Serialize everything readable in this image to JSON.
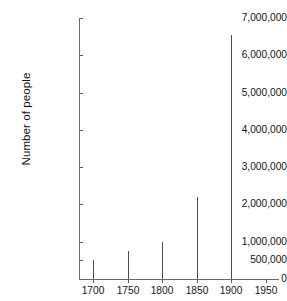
{
  "chart_data": {
    "type": "bar",
    "title": "",
    "subtitle": "",
    "xlabel": "",
    "ylabel": "Number of people",
    "categories": [
      "1700",
      "1750",
      "1800",
      "1850",
      "1900"
    ],
    "x": [
      1700,
      1750,
      1800,
      1850,
      1900
    ],
    "values": [
      500000,
      750000,
      1000000,
      2200000,
      6550000
    ],
    "xlim": [
      1675,
      1960
    ],
    "ylim": [
      0,
      7000000
    ],
    "x_ticks": [
      1700,
      1750,
      1800,
      1850,
      1900,
      1950
    ],
    "x_tick_labels": [
      "1700",
      "1750",
      "1800",
      "1850",
      "1900",
      "1950"
    ],
    "y_ticks": [
      0,
      500000,
      1000000,
      2000000,
      3000000,
      4000000,
      5000000,
      6000000,
      7000000
    ],
    "y_tick_labels": [
      "0",
      "500,000",
      "1,000,000",
      "2,000,000",
      "3,000,000",
      "4,000,000",
      "5,000,000",
      "6,000,000",
      "7,000,000"
    ],
    "grid": false,
    "legend": false,
    "legend_position": "none",
    "series": [
      {
        "name": "Number of people",
        "values": [
          500000,
          750000,
          1000000,
          2200000,
          6550000
        ]
      }
    ],
    "bar_color": "#4d4d4d",
    "axis_color": "#6b6b6b",
    "background_color": "#ffffff",
    "text_color": "#141414",
    "annotations": []
  }
}
